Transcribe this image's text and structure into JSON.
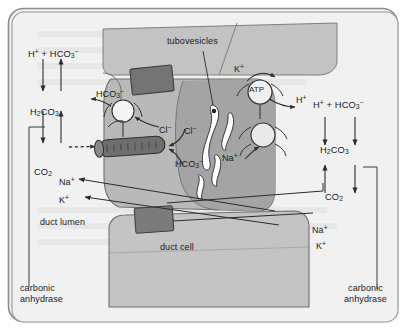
{
  "figure": {
    "border_color": "#6e6e6e",
    "background": "#f1f1f1",
    "cell_fill_light": "#c9c9c9",
    "cell_fill_mid": "#b2b2b2",
    "cell_fill_dark": "#9a9a9a",
    "channel_fill": "#6d6d6d",
    "vesicle_fill": "#ffffff",
    "line_color": "#2b2b2b"
  },
  "labels": {
    "tubovesicles": "tubovesicles",
    "duct_lumen": "duct lumen",
    "duct_cell": "duct cell",
    "carbonic_anhydrase_left_line1": "carbonic",
    "carbonic_anhydrase_left_line2": "anhydrase",
    "carbonic_anhydrase_right_line1": "carbonic",
    "carbonic_anhydrase_right_line2": "anhydrase"
  },
  "left_reaction": {
    "top": {
      "h": "H",
      "h_charge": "+",
      "plus": " + ",
      "hco3": "HCO",
      "hco3_sub": "3",
      "hco3_charge": "−"
    },
    "middle": {
      "formula": "H",
      "sub1": "2",
      "mid": "CO",
      "sub2": "3"
    },
    "bottom": {
      "formula": "CO",
      "sub": "2"
    }
  },
  "right_reaction": {
    "top": {
      "h": "H",
      "h_charge": "+",
      "plus": " + ",
      "hco3": "HCO",
      "hco3_sub": "3",
      "hco3_charge": "−"
    },
    "middle": {
      "formula": "H",
      "sub1": "2",
      "mid": "CO",
      "sub2": "3"
    },
    "bottom": {
      "formula": "CO",
      "sub": "2"
    }
  },
  "ions": {
    "hco3_apical": {
      "base": "HCO",
      "sub": "3",
      "charge": "−"
    },
    "cl_inner": {
      "base": "Cl",
      "charge": "−"
    },
    "cl_outer": {
      "base": "Cl",
      "charge": "−"
    },
    "hco3_channel": {
      "base": "HCO",
      "sub": "3",
      "charge": "−"
    },
    "k_pump": {
      "base": "K",
      "charge": "+"
    },
    "atp": "ATP",
    "h_secreted": {
      "base": "H",
      "charge": "+"
    },
    "na_cell": {
      "base": "Na",
      "charge": "+"
    },
    "na_lumen_left": {
      "base": "Na",
      "charge": "+"
    },
    "k_lumen_left": {
      "base": "K",
      "charge": "+"
    },
    "na_right": {
      "base": "Na",
      "charge": "+"
    },
    "k_right": {
      "base": "K",
      "charge": "+"
    }
  }
}
